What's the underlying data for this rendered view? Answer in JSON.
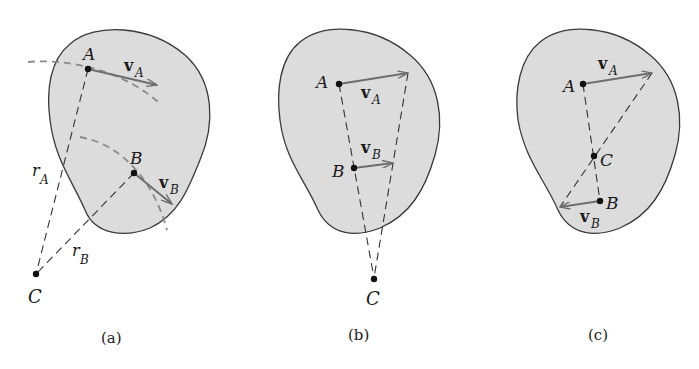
{
  "figure": {
    "colors": {
      "body_fill": "#dcdcdc",
      "body_outline": "#3a3a3a",
      "vector": "#6e6e6e",
      "dash_line": "#333333",
      "arc_dash": "#8a8a8a",
      "point": "#111111",
      "text": "#1a1a1a"
    },
    "panels": [
      {
        "id": "a",
        "caption": "(a)",
        "points": {
          "A": "A",
          "B": "B",
          "C": "C"
        },
        "vectors": {
          "vA": "v",
          "vA_sub": "A",
          "vB": "v",
          "vB_sub": "B"
        },
        "radii": {
          "rA": "r",
          "rA_sub": "A",
          "rB": "r",
          "rB_sub": "B"
        }
      },
      {
        "id": "b",
        "caption": "(b)",
        "points": {
          "A": "A",
          "B": "B",
          "C": "C"
        },
        "vectors": {
          "vA": "v",
          "vA_sub": "A",
          "vB": "v",
          "vB_sub": "B"
        }
      },
      {
        "id": "c",
        "caption": "(c)",
        "points": {
          "A": "A",
          "B": "B",
          "C": "C"
        },
        "vectors": {
          "vA": "v",
          "vA_sub": "A",
          "vB": "v",
          "vB_sub": "B"
        }
      }
    ]
  }
}
